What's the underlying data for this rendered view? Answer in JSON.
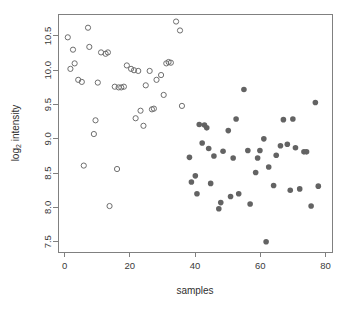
{
  "chart_data": {
    "type": "scatter",
    "title": "",
    "xlabel": "samples",
    "ylabel": "log2 intensity",
    "ylabel_base": "log",
    "ylabel_sub": "2",
    "ylabel_rest": " intensity",
    "xlim": [
      -2,
      82
    ],
    "ylim": [
      7.35,
      10.82
    ],
    "xticks": [
      0,
      20,
      40,
      60,
      80
    ],
    "yticks": [
      7.5,
      8.0,
      8.5,
      9.0,
      9.5,
      10.0,
      10.5
    ],
    "ytick_labels": [
      "7.5",
      "8.0",
      "8.5",
      "9.0",
      "9.5",
      "10.0",
      "10.5"
    ],
    "xtick_labels": [
      "0",
      "20",
      "40",
      "60",
      "80"
    ],
    "grid": false,
    "legend": "none",
    "frame": true,
    "series": [
      {
        "name": "group-1-open",
        "marker": "open-circle",
        "color": "#6e6e6e",
        "points": [
          [
            1,
            10.48
          ],
          [
            1.8,
            10.02
          ],
          [
            2.6,
            10.3
          ],
          [
            3.1,
            10.1
          ],
          [
            4.2,
            9.86
          ],
          [
            5.3,
            9.83
          ],
          [
            5.9,
            8.61
          ],
          [
            7.2,
            10.62
          ],
          [
            7.6,
            10.34
          ],
          [
            9.0,
            9.07
          ],
          [
            9.5,
            9.27
          ],
          [
            10.2,
            9.82
          ],
          [
            11.2,
            10.26
          ],
          [
            12.6,
            10.24
          ],
          [
            13.3,
            10.26
          ],
          [
            13.8,
            8.02
          ],
          [
            15.4,
            9.76
          ],
          [
            16.1,
            8.56
          ],
          [
            16.6,
            9.75
          ],
          [
            17.4,
            9.75
          ],
          [
            18.2,
            9.76
          ],
          [
            19.1,
            10.07
          ],
          [
            20.4,
            10.02
          ],
          [
            21.3,
            10.0
          ],
          [
            21.8,
            9.3
          ],
          [
            22.6,
            9.99
          ],
          [
            23.3,
            9.41
          ],
          [
            24.2,
            9.19
          ],
          [
            24.9,
            9.78
          ],
          [
            26.1,
            9.99
          ],
          [
            26.8,
            9.43
          ],
          [
            27.4,
            9.44
          ],
          [
            28.2,
            9.86
          ],
          [
            29.6,
            9.93
          ],
          [
            30.4,
            9.64
          ],
          [
            31.2,
            10.1
          ],
          [
            31.9,
            10.12
          ],
          [
            32.6,
            10.11
          ],
          [
            34.2,
            10.71
          ],
          [
            35.4,
            10.58
          ],
          [
            36.0,
            9.48
          ]
        ]
      },
      {
        "name": "group-2-filled",
        "marker": "filled-circle",
        "color": "#636363",
        "points": [
          [
            38.3,
            8.73
          ],
          [
            38.9,
            8.37
          ],
          [
            40.1,
            8.46
          ],
          [
            40.6,
            8.2
          ],
          [
            41.3,
            9.21
          ],
          [
            42.2,
            8.94
          ],
          [
            42.9,
            9.2
          ],
          [
            43.6,
            9.16
          ],
          [
            44.2,
            8.86
          ],
          [
            44.8,
            8.35
          ],
          [
            45.8,
            8.75
          ],
          [
            47.3,
            7.98
          ],
          [
            47.9,
            8.07
          ],
          [
            48.6,
            8.82
          ],
          [
            50.2,
            9.12
          ],
          [
            50.9,
            8.16
          ],
          [
            51.7,
            8.72
          ],
          [
            52.6,
            9.29
          ],
          [
            53.4,
            8.2
          ],
          [
            55.0,
            9.72
          ],
          [
            56.2,
            8.83
          ],
          [
            56.9,
            8.05
          ],
          [
            58.6,
            8.51
          ],
          [
            59.2,
            8.72
          ],
          [
            59.9,
            8.83
          ],
          [
            61.1,
            9.0
          ],
          [
            61.8,
            7.5
          ],
          [
            62.6,
            8.59
          ],
          [
            64.1,
            8.32
          ],
          [
            64.9,
            8.76
          ],
          [
            66.2,
            8.9
          ],
          [
            67.1,
            9.28
          ],
          [
            68.3,
            8.92
          ],
          [
            69.2,
            8.25
          ],
          [
            70.0,
            9.29
          ],
          [
            70.8,
            8.87
          ],
          [
            72.1,
            8.27
          ],
          [
            73.4,
            8.81
          ],
          [
            74.2,
            8.81
          ],
          [
            75.6,
            8.02
          ],
          [
            76.9,
            9.53
          ],
          [
            77.8,
            8.31
          ]
        ]
      }
    ]
  }
}
